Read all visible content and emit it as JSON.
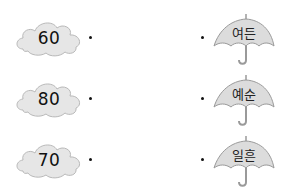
{
  "colors": {
    "cloud_fill": "#e6e6e6",
    "cloud_stroke": "#b9b9b9",
    "umbrella_fill": "#dcdcdc",
    "umbrella_stroke": "#9a9a9a",
    "text": "#111111"
  },
  "left_items": [
    {
      "icon": "cloud-icon",
      "value": "60"
    },
    {
      "icon": "cloud-icon",
      "value": "80"
    },
    {
      "icon": "cloud-icon",
      "value": "70"
    }
  ],
  "right_items": [
    {
      "icon": "umbrella-icon",
      "label": "여든"
    },
    {
      "icon": "umbrella-icon",
      "label": "예순"
    },
    {
      "icon": "umbrella-icon",
      "label": "일흔"
    }
  ]
}
